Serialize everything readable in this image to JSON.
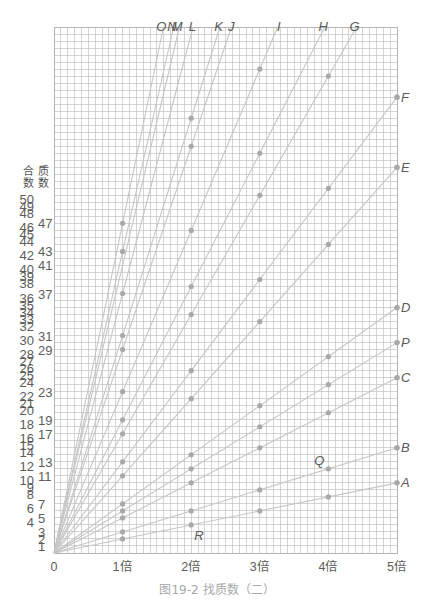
{
  "caption": "图19-2  找质数（二）",
  "y_axis_headers": {
    "composite_top": "合",
    "composite_bottom": "数",
    "prime_top": "质",
    "prime_bottom": "数"
  },
  "chart_data": {
    "type": "line",
    "title": "图19-2  找质数（二）",
    "xlabel": "",
    "ylabel": "合数 / 质数",
    "xlim": [
      0,
      5
    ],
    "ylim": [
      0,
      75
    ],
    "grid": true,
    "grid_cols": 50,
    "grid_rows": 75,
    "legend": "none",
    "x_ticks": [
      {
        "value": 0,
        "label": "0"
      },
      {
        "value": 1,
        "label": "1倍"
      },
      {
        "value": 2,
        "label": "2倍"
      },
      {
        "value": 3,
        "label": "3倍"
      },
      {
        "value": 4,
        "label": "4倍"
      },
      {
        "value": 5,
        "label": "5倍"
      }
    ],
    "composite_labels": [
      50,
      49,
      48,
      46,
      45,
      44,
      42,
      40,
      39,
      38,
      36,
      35,
      34,
      33,
      32,
      30,
      28,
      27,
      26,
      25,
      24,
      22,
      21,
      20,
      18,
      16,
      15,
      14,
      12,
      10,
      9,
      8,
      6,
      4
    ],
    "prime_labels": [
      47,
      43,
      41,
      37,
      31,
      29,
      23,
      19,
      17,
      13,
      11,
      7,
      5,
      3,
      2,
      1
    ],
    "series": [
      {
        "name": "A",
        "slope": 2,
        "points": [
          [
            1,
            2
          ],
          [
            2,
            4
          ],
          [
            3,
            6
          ],
          [
            4,
            8
          ],
          [
            5,
            10
          ]
        ]
      },
      {
        "name": "B",
        "slope": 3,
        "points": [
          [
            1,
            3
          ],
          [
            2,
            6
          ],
          [
            3,
            9
          ],
          [
            4,
            12
          ],
          [
            5,
            15
          ]
        ]
      },
      {
        "name": "C",
        "slope": 5,
        "points": [
          [
            1,
            5
          ],
          [
            2,
            10
          ],
          [
            3,
            15
          ],
          [
            4,
            20
          ],
          [
            5,
            25
          ]
        ]
      },
      {
        "name": "P",
        "slope": 6,
        "points": [
          [
            1,
            6
          ],
          [
            2,
            12
          ],
          [
            3,
            18
          ],
          [
            4,
            24
          ],
          [
            5,
            30
          ]
        ]
      },
      {
        "name": "D",
        "slope": 7,
        "points": [
          [
            1,
            7
          ],
          [
            2,
            14
          ],
          [
            3,
            21
          ],
          [
            4,
            28
          ],
          [
            5,
            35
          ]
        ]
      },
      {
        "name": "E",
        "slope": 11,
        "points": [
          [
            1,
            11
          ],
          [
            2,
            22
          ],
          [
            3,
            33
          ],
          [
            4,
            44
          ],
          [
            5,
            55
          ]
        ]
      },
      {
        "name": "F",
        "slope": 13,
        "points": [
          [
            1,
            13
          ],
          [
            2,
            26
          ],
          [
            3,
            39
          ],
          [
            4,
            52
          ],
          [
            5,
            65
          ]
        ]
      },
      {
        "name": "G",
        "slope": 17,
        "points": [
          [
            1,
            17
          ],
          [
            2,
            34
          ],
          [
            3,
            51
          ],
          [
            4,
            68
          ]
        ]
      },
      {
        "name": "H",
        "slope": 19,
        "points": [
          [
            1,
            19
          ],
          [
            2,
            38
          ],
          [
            3,
            57
          ]
        ]
      },
      {
        "name": "I",
        "slope": 23,
        "points": [
          [
            1,
            23
          ],
          [
            2,
            46
          ],
          [
            3,
            69
          ]
        ]
      },
      {
        "name": "J",
        "slope": 29,
        "points": [
          [
            1,
            29
          ],
          [
            2,
            58
          ]
        ]
      },
      {
        "name": "K",
        "slope": 31,
        "points": [
          [
            1,
            31
          ],
          [
            2,
            62
          ]
        ]
      },
      {
        "name": "L",
        "slope": 37,
        "points": [
          [
            1,
            37
          ]
        ]
      },
      {
        "name": "M",
        "slope": 41,
        "points": []
      },
      {
        "name": "N",
        "slope": 43,
        "points": [
          [
            1,
            43
          ]
        ]
      },
      {
        "name": "O",
        "slope": 47,
        "points": [
          [
            1,
            47
          ]
        ]
      }
    ],
    "annotations": [
      {
        "text": "Q",
        "x": 4,
        "y": 12,
        "position": "upper-left"
      },
      {
        "text": "R",
        "x": 2,
        "y": 4,
        "position": "lower-right"
      }
    ]
  }
}
